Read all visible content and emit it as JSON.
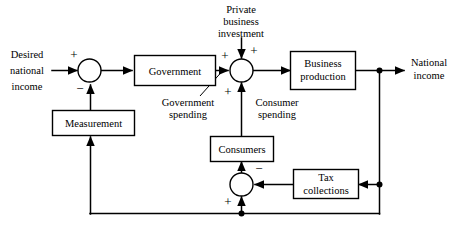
{
  "figure": {
    "type": "block-diagram",
    "domain": "control-systems-economics",
    "width": 454,
    "height": 232,
    "background_color": "#ffffff",
    "line_color": "#000000"
  },
  "blocks": [
    {
      "id": "government",
      "label_line1": "Government",
      "label_line2": ""
    },
    {
      "id": "measurement",
      "label_line1": "Measurement",
      "label_line2": ""
    },
    {
      "id": "business_production",
      "label_line1": "Business",
      "label_line2": "production"
    },
    {
      "id": "consumers",
      "label_line1": "Consumers",
      "label_line2": ""
    },
    {
      "id": "tax_collections",
      "label_line1": "Tax",
      "label_line2": "collections"
    }
  ],
  "inputs": {
    "desired_income_line1": "Desired",
    "desired_income_line2": "national",
    "desired_income_line3": "income",
    "private_investment_line1": "Private",
    "private_investment_line2": "business",
    "private_investment_line3": "investment"
  },
  "outputs": {
    "national_income_line1": "National",
    "national_income_line2": "income"
  },
  "annotations": {
    "government_spending_line1": "Government",
    "government_spending_line2": "spending",
    "consumer_spending_line1": "Consumer",
    "consumer_spending_line2": "spending"
  },
  "signs": {
    "sum1_input_plus": "+",
    "sum1_feedback_minus": "−",
    "sum2_left_plus": "+",
    "sum2_top_plus": "+",
    "sum2_bottom_plus": "+",
    "sum3_right_minus": "−",
    "sum3_bottom_plus": "+"
  }
}
